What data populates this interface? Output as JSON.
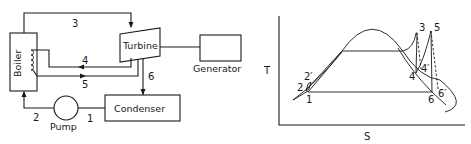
{
  "schematic": {
    "components": {
      "boiler": "Boiler",
      "turbine": "Turbine",
      "generator": "Generator",
      "condenser": "Condenser",
      "pump": "Pump"
    },
    "state_points": {
      "p1": "1",
      "p2": "2",
      "p3": "3",
      "p4": "4",
      "p5": "5",
      "p6": "6"
    }
  },
  "ts_diagram": {
    "axis_y": "T",
    "axis_x": "S",
    "points": {
      "p1": "1",
      "p2": "2",
      "p2p": "2′",
      "p3": "3",
      "p4": "4",
      "p4p": "4′",
      "p5": "5",
      "p6": "6",
      "p6p": "6′"
    }
  }
}
